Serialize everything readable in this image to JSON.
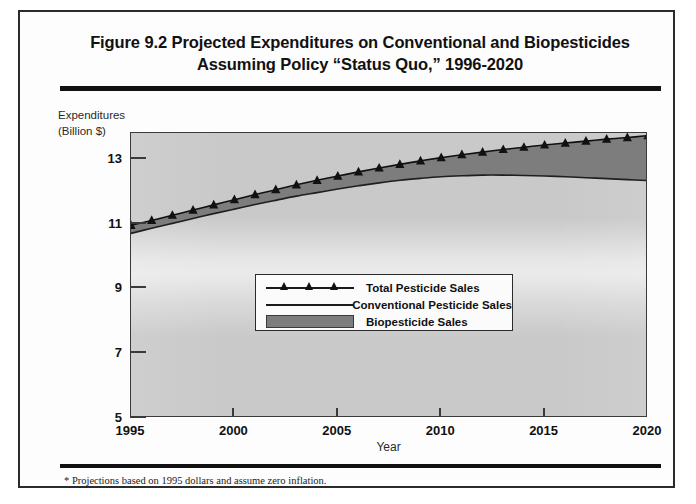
{
  "figure": {
    "title_line1": "Figure 9.2 Projected Expenditures on Conventional and Biopesticides",
    "title_line2": "Assuming Policy “Status Quo,” 1996-2020",
    "footnote": "* Projections based on 1995 dollars and assume zero inflation."
  },
  "axis": {
    "ylabel_line1": "Expenditures",
    "ylabel_line2": "(Billion $)",
    "xlabel": "Year"
  },
  "legend": {
    "items": [
      {
        "label": "Total Pesticide Sales",
        "key": "line-with-triangle-markers",
        "color": "#111111"
      },
      {
        "label": "Conventional Pesticide Sales",
        "key": "plain-line",
        "color": "#1a1a1a"
      },
      {
        "label": "Biopesticide Sales",
        "key": "filled-swatch",
        "color": "#7d7d7d"
      }
    ]
  },
  "colors": {
    "plot_background": "#c9c9c9",
    "biopesticide_band": "#7d7d7d",
    "line": "#111111",
    "frame": "#2b2b2b"
  },
  "chart_data": {
    "type": "area",
    "title": "Figure 9.2 Projected Expenditures on Conventional and Biopesticides Assuming Policy “Status Quo,” 1996-2020",
    "xlabel": "Year",
    "ylabel": "Expenditures (Billion $)",
    "xlim": [
      1995,
      2020
    ],
    "ylim": [
      5,
      13.8
    ],
    "yticks": [
      5,
      7,
      9,
      11,
      13
    ],
    "xticks": [
      1995,
      2000,
      2005,
      2010,
      2015,
      2020
    ],
    "grid": false,
    "legend_position": "center",
    "x": [
      1995,
      1996,
      1997,
      1998,
      1999,
      2000,
      2001,
      2002,
      2003,
      2004,
      2005,
      2006,
      2007,
      2008,
      2009,
      2010,
      2011,
      2012,
      2013,
      2014,
      2015,
      2016,
      2017,
      2018,
      2019,
      2020
    ],
    "series": [
      {
        "name": "Total Pesticide Sales",
        "marker": "triangle",
        "values": [
          10.95,
          11.1,
          11.26,
          11.42,
          11.58,
          11.74,
          11.9,
          12.05,
          12.2,
          12.34,
          12.47,
          12.6,
          12.72,
          12.83,
          12.94,
          13.04,
          13.13,
          13.21,
          13.29,
          13.36,
          13.43,
          13.49,
          13.55,
          13.61,
          13.66,
          13.72
        ]
      },
      {
        "name": "Conventional Pesticide Sales",
        "marker": "none",
        "values": [
          10.7,
          10.86,
          11.01,
          11.16,
          11.31,
          11.45,
          11.59,
          11.72,
          11.85,
          11.96,
          12.07,
          12.17,
          12.26,
          12.34,
          12.4,
          12.45,
          12.48,
          12.5,
          12.5,
          12.49,
          12.47,
          12.45,
          12.42,
          12.39,
          12.36,
          12.33
        ]
      },
      {
        "name": "Biopesticide Sales",
        "marker": "band",
        "note": "Shaded band = Total minus Conventional",
        "values": [
          0.25,
          0.24,
          0.25,
          0.26,
          0.27,
          0.29,
          0.31,
          0.33,
          0.35,
          0.38,
          0.4,
          0.43,
          0.46,
          0.49,
          0.54,
          0.59,
          0.65,
          0.71,
          0.79,
          0.87,
          0.96,
          1.04,
          1.13,
          1.22,
          1.3,
          1.39
        ]
      }
    ]
  }
}
